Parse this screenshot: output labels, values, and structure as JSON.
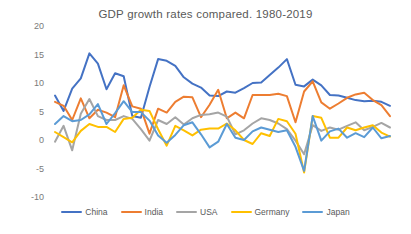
{
  "chart_data": {
    "type": "line",
    "title": "GDP growth rates compared. 1980-2019",
    "grid": false,
    "legend_position": "bottom",
    "x": [
      1980,
      1981,
      1982,
      1983,
      1984,
      1985,
      1986,
      1987,
      1988,
      1989,
      1990,
      1991,
      1992,
      1993,
      1994,
      1995,
      1996,
      1997,
      1998,
      1999,
      2000,
      2001,
      2002,
      2003,
      2004,
      2005,
      2006,
      2007,
      2008,
      2009,
      2010,
      2011,
      2012,
      2013,
      2014,
      2015,
      2016,
      2017,
      2018,
      2019
    ],
    "x_tick_labels_visible": false,
    "ylim": [
      -10,
      20
    ],
    "yticks": [
      20,
      15,
      10,
      5,
      0,
      -5,
      -10
    ],
    "ylabel": "",
    "xlabel": "",
    "series": [
      {
        "name": "China",
        "color": "#4472C4",
        "values": [
          7.8,
          5.1,
          9.0,
          10.8,
          15.2,
          13.4,
          8.9,
          11.7,
          11.2,
          4.2,
          3.9,
          9.3,
          14.2,
          13.9,
          13.0,
          11.0,
          9.9,
          9.2,
          7.8,
          7.7,
          8.5,
          8.3,
          9.1,
          10.0,
          10.1,
          11.4,
          12.7,
          14.2,
          9.7,
          9.4,
          10.6,
          9.6,
          7.9,
          7.8,
          7.4,
          7.0,
          6.8,
          6.9,
          6.7,
          6.0
        ]
      },
      {
        "name": "India",
        "color": "#ED7D31",
        "values": [
          6.7,
          6.0,
          3.5,
          7.3,
          3.8,
          5.3,
          4.8,
          4.0,
          9.6,
          5.9,
          5.5,
          1.1,
          5.5,
          4.8,
          6.7,
          7.6,
          7.5,
          4.0,
          6.2,
          8.8,
          3.8,
          4.8,
          3.8,
          7.9,
          7.9,
          7.9,
          8.1,
          7.7,
          3.1,
          8.5,
          10.3,
          6.6,
          5.5,
          6.4,
          7.4,
          8.0,
          8.3,
          7.0,
          6.1,
          4.2
        ]
      },
      {
        "name": "USA",
        "color": "#A5A5A5",
        "values": [
          -0.3,
          2.5,
          -1.8,
          4.6,
          7.2,
          4.2,
          3.5,
          3.5,
          4.2,
          3.7,
          1.9,
          -0.1,
          3.5,
          2.8,
          4.0,
          2.7,
          3.8,
          4.4,
          4.5,
          4.8,
          4.1,
          1.0,
          1.7,
          2.9,
          3.8,
          3.5,
          2.9,
          1.9,
          -0.1,
          -2.5,
          2.6,
          1.6,
          2.2,
          1.8,
          2.5,
          3.1,
          1.7,
          2.3,
          3.0,
          2.2
        ]
      },
      {
        "name": "Germany",
        "color": "#FFC000",
        "values": [
          1.4,
          0.5,
          -0.4,
          1.6,
          2.8,
          2.3,
          2.3,
          1.4,
          3.7,
          3.9,
          5.3,
          5.1,
          1.9,
          -1.0,
          2.5,
          1.7,
          0.8,
          1.8,
          2.0,
          2.0,
          2.9,
          1.7,
          0.0,
          -0.7,
          1.2,
          0.7,
          3.7,
          3.3,
          1.1,
          -5.7,
          4.2,
          3.9,
          0.4,
          0.4,
          2.2,
          1.7,
          2.2,
          2.6,
          1.3,
          0.6
        ]
      },
      {
        "name": "Japan",
        "color": "#5B9BD5",
        "values": [
          2.8,
          4.2,
          3.3,
          3.5,
          4.5,
          6.3,
          2.8,
          4.7,
          6.8,
          4.9,
          4.9,
          3.4,
          0.8,
          -0.5,
          0.9,
          2.6,
          3.1,
          1.0,
          -1.3,
          -0.3,
          2.8,
          0.4,
          0.0,
          1.5,
          2.2,
          1.8,
          1.4,
          1.7,
          -1.2,
          -5.4,
          4.2,
          -0.1,
          1.5,
          2.0,
          0.4,
          1.2,
          0.5,
          2.2,
          0.3,
          0.7
        ]
      }
    ]
  },
  "colors": {
    "background": "#FFFFFF",
    "title_text": "#595959",
    "axis_text": "#7A7A7A",
    "legend_text": "#595959"
  }
}
